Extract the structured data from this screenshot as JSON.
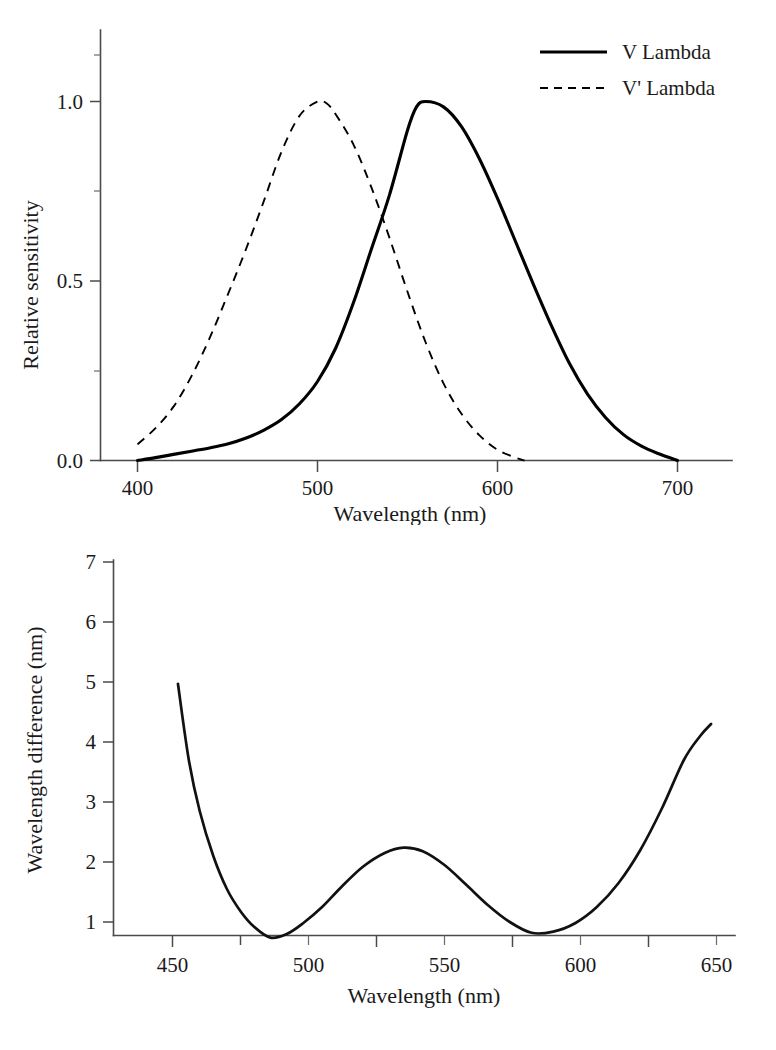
{
  "figure": {
    "background": "#ffffff",
    "ink_color": "#000000",
    "axis_color": "#4a4a4a"
  },
  "chart_data": [
    {
      "id": "luminous-efficiency",
      "type": "line",
      "title": "",
      "xlabel": "Wavelength (nm)",
      "ylabel": "Relative sensitivity",
      "xlim": [
        385,
        715
      ],
      "ylim": [
        0.0,
        1.12
      ],
      "xticks": [
        400,
        500,
        600,
        700
      ],
      "xticklabels": [
        "400",
        "500",
        "600",
        "700"
      ],
      "xminorticks": [
        450,
        550,
        650
      ],
      "yticks": [
        0.0,
        0.5,
        1.0
      ],
      "yticklabels": [
        "0.0",
        "0.5",
        "1.0"
      ],
      "yminorticks": [
        0.25,
        0.75
      ],
      "grid": false,
      "legend_position": "top-right",
      "series": [
        {
          "name": "V Lambda",
          "style": "solid",
          "color": "#000000",
          "peak_x": 557,
          "peak_y": 1.0,
          "x": [
            400,
            410,
            420,
            430,
            440,
            450,
            460,
            470,
            480,
            490,
            500,
            510,
            520,
            530,
            540,
            550,
            555,
            560,
            570,
            580,
            590,
            600,
            610,
            620,
            630,
            640,
            650,
            660,
            670,
            680,
            690,
            700
          ],
          "y": [
            0.0,
            0.008,
            0.017,
            0.026,
            0.035,
            0.046,
            0.062,
            0.084,
            0.114,
            0.158,
            0.22,
            0.312,
            0.44,
            0.59,
            0.74,
            0.92,
            0.985,
            1.0,
            0.985,
            0.93,
            0.84,
            0.73,
            0.61,
            0.49,
            0.375,
            0.27,
            0.185,
            0.12,
            0.072,
            0.04,
            0.018,
            0.0
          ]
        },
        {
          "name": "V' Lambda",
          "style": "dashed",
          "color": "#000000",
          "peak_x": 500,
          "peak_y": 1.0,
          "x": [
            400,
            410,
            420,
            430,
            440,
            450,
            460,
            470,
            480,
            490,
            500,
            505,
            510,
            520,
            530,
            540,
            550,
            560,
            570,
            580,
            590,
            600,
            610,
            615
          ],
          "y": [
            0.045,
            0.09,
            0.15,
            0.235,
            0.34,
            0.46,
            0.585,
            0.72,
            0.86,
            0.96,
            1.0,
            0.995,
            0.965,
            0.88,
            0.76,
            0.62,
            0.47,
            0.33,
            0.215,
            0.13,
            0.07,
            0.03,
            0.008,
            0.0
          ]
        }
      ],
      "legend": [
        {
          "label": "V Lambda",
          "style": "solid"
        },
        {
          "label": "V' Lambda",
          "style": "dashed"
        }
      ]
    },
    {
      "id": "wavelength-difference",
      "type": "line",
      "title": "",
      "xlabel": "Wavelength (nm)",
      "ylabel": "Wavelength difference (nm)",
      "xlim": [
        440,
        653
      ],
      "ylim": [
        0.45,
        7.3
      ],
      "xticks": [
        450,
        500,
        550,
        600,
        650
      ],
      "xticklabels": [
        "450",
        "500",
        "550",
        "600",
        "650"
      ],
      "xminorticks": [
        475,
        525,
        575,
        625
      ],
      "yticks": [
        1,
        2,
        3,
        4,
        5,
        6,
        7
      ],
      "yticklabels": [
        "1",
        "2",
        "3",
        "4",
        "5",
        "6",
        "7"
      ],
      "yminorticks": [
        1.5,
        2.5,
        3.5,
        4.5,
        5.5,
        6.5
      ],
      "grid": false,
      "legend_position": "none",
      "series": [
        {
          "name": "Wavelength difference",
          "style": "solid",
          "color": "#111111",
          "x": [
            452,
            456,
            460,
            465,
            470,
            475,
            480,
            486,
            492,
            498,
            505,
            512,
            520,
            528,
            535,
            542,
            550,
            558,
            566,
            574,
            582,
            590,
            598,
            606,
            614,
            622,
            630,
            638,
            644,
            648
          ],
          "y": [
            4.97,
            3.7,
            2.85,
            2.1,
            1.55,
            1.18,
            0.92,
            0.74,
            0.8,
            0.98,
            1.25,
            1.58,
            1.92,
            2.15,
            2.24,
            2.18,
            1.95,
            1.62,
            1.28,
            1.0,
            0.82,
            0.84,
            0.98,
            1.25,
            1.65,
            2.2,
            2.9,
            3.7,
            4.1,
            4.3
          ]
        }
      ],
      "annotations": {
        "left_endpoint": {
          "x": 452,
          "y": 4.97
        },
        "first_minimum": {
          "x": 486,
          "y": 0.74
        },
        "local_maximum": {
          "x": 535,
          "y": 2.24
        },
        "second_minimum": {
          "x": 582,
          "y": 0.82
        },
        "right_endpoint": {
          "x": 648,
          "y": 4.3
        }
      }
    }
  ]
}
